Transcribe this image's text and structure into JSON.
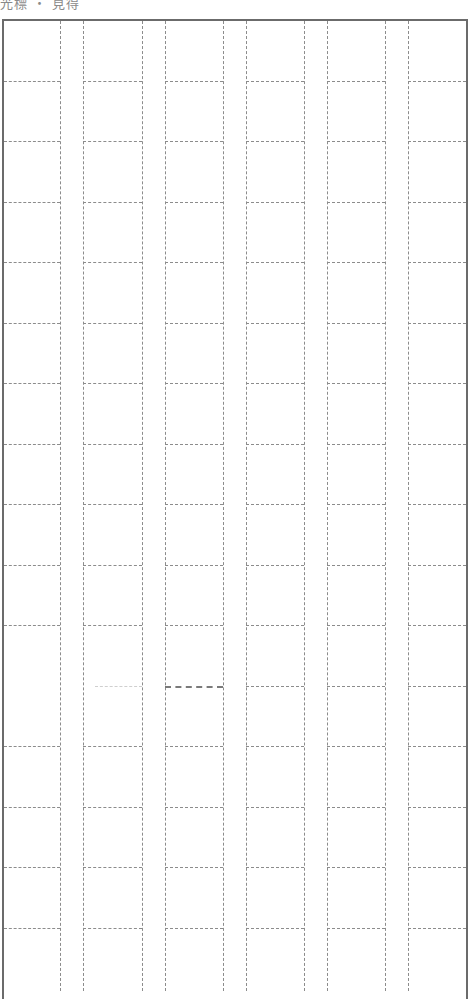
{
  "header": {
    "label": "光標 ・ 見得"
  },
  "grid": {
    "columns": 6,
    "rows_visible": 16,
    "column_lines_x": [
      60,
      83,
      142,
      165,
      223,
      246,
      304,
      327,
      385,
      408
    ],
    "cell_spans_x": [
      [
        4,
        60
      ],
      [
        83,
        142
      ],
      [
        165,
        223
      ],
      [
        246,
        304
      ],
      [
        327,
        385
      ],
      [
        408,
        466
      ]
    ],
    "row_lines_y": [
      81,
      141,
      202,
      262,
      323,
      383,
      444,
      504,
      565,
      625,
      686,
      746,
      807,
      867,
      928
    ],
    "line_color": "#8c8c8c",
    "border_color": "#6b6b6b",
    "anomalies": [
      {
        "row_y": 686,
        "column": 0,
        "style": "missing"
      },
      {
        "row_y": 686,
        "column": 1,
        "style": "faint"
      },
      {
        "row_y": 686,
        "column": 2,
        "style": "dark"
      }
    ]
  }
}
